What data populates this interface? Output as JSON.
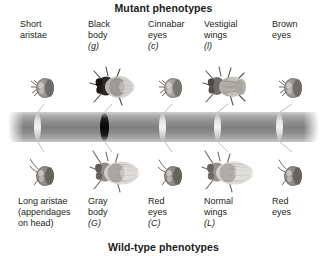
{
  "figure": {
    "top_title": "Mutant phenotypes",
    "bottom_title": "Wild-type phenotypes"
  },
  "mutant_phenotypes": [
    {
      "name": "Short\naristae",
      "allele": "",
      "art": "fly-head-dark"
    },
    {
      "name": "Black\nbody",
      "allele": "(g)",
      "art": "fly-black-body"
    },
    {
      "name": "Cinnabar\neyes",
      "allele": "(c)",
      "art": "fly-head-light"
    },
    {
      "name": "Vestigial\nwings",
      "allele": "(l)",
      "art": "fly-vestigial-wings"
    },
    {
      "name": "Brown\neyes",
      "allele": "",
      "art": "fly-head-dark"
    }
  ],
  "wildtype_phenotypes": [
    {
      "name": "Long aristae\n(appendages\non head)",
      "allele": "",
      "art": "fly-head-long-aristae"
    },
    {
      "name": "Gray\nbody",
      "allele": "(G)",
      "art": "fly-gray-body"
    },
    {
      "name": "Red\neyes",
      "allele": "(C)",
      "art": "fly-head-red-eyes"
    },
    {
      "name": "Normal\nwings",
      "allele": "(L)",
      "art": "fly-normal-wings"
    },
    {
      "name": "Red\neyes",
      "allele": "",
      "art": "fly-head-red-eyes"
    }
  ],
  "chromosome": {
    "label": "chromosome",
    "bands": [
      {
        "position_px": 30,
        "type": "light"
      },
      {
        "position_px": 97,
        "type": "dark"
      },
      {
        "position_px": 155,
        "type": "light"
      },
      {
        "position_px": 210,
        "type": "light"
      },
      {
        "position_px": 272,
        "type": "light"
      }
    ]
  },
  "colors": {
    "text": "#231f20",
    "chromosome_mid": "#7f7f7f",
    "chromosome_edge": "#cfcfcf",
    "centromere": "#050505",
    "background": "#ffffff"
  }
}
